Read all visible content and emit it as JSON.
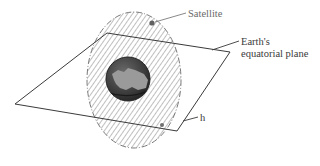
{
  "diagram": {
    "type": "polar-orbit-illustration",
    "labels": {
      "satellite": "Satellite",
      "plane_line1": "Earth's",
      "plane_line2": "equatorial plane",
      "altitude": "h"
    },
    "colors": {
      "line": "#3a3a3a",
      "hatch": "#7a7a7a",
      "orbit_outline": "#7a7a7a",
      "earth_dark": "#3c3c3c",
      "earth_land": "#9a9a9a",
      "satellite": "#606060"
    }
  }
}
